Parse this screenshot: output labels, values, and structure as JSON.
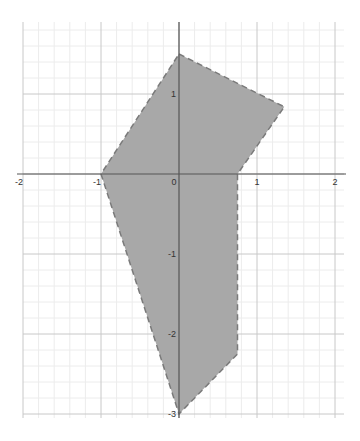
{
  "chart_data": {
    "type": "area",
    "title": "",
    "xlabel": "",
    "ylabel": "",
    "xlim": [
      -2.05,
      2.1
    ],
    "ylim": [
      -3.05,
      1.9
    ],
    "grid": true,
    "minor_grid_per_unit": 5,
    "x_ticks": [
      -2,
      -1,
      0,
      1,
      2
    ],
    "y_ticks": [
      1,
      -1,
      -2,
      -3
    ],
    "x_tick_labels": [
      "-2",
      "-1",
      "0",
      "1",
      "2"
    ],
    "y_tick_labels": [
      "1",
      "-1",
      "-2",
      "-3"
    ],
    "series": [
      {
        "name": "shaded polygon region",
        "kind": "polygon",
        "border": "dashed",
        "fill_color": "#a8a8a8",
        "stroke_color": "#7a7a7a",
        "vertices": [
          [
            0,
            1.5
          ],
          [
            1.35,
            0.84
          ],
          [
            0.75,
            0
          ],
          [
            0.75,
            -2.25
          ],
          [
            0,
            -3
          ],
          [
            -1,
            0
          ]
        ]
      }
    ]
  },
  "layout": {
    "origin_px": [
      179,
      174
    ],
    "unit_px_x": 78,
    "unit_px_y": 80,
    "grid_box": [
      23,
      22,
      344,
      418
    ],
    "colors": {
      "axis": "#555555",
      "major_grid": "#c8c8c8",
      "minor_grid": "#ececec"
    }
  }
}
